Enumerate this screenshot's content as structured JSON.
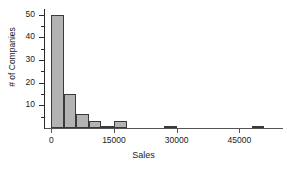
{
  "chart_data": {
    "type": "bar",
    "title": "",
    "xlabel": "Sales",
    "ylabel": "# of Companies",
    "bin_width": 3000,
    "xlim": [
      -1500,
      54000
    ],
    "ylim": [
      0,
      52
    ],
    "grid": false,
    "legend": null,
    "x_ticks": [
      0,
      15000,
      30000,
      45000
    ],
    "x_tick_labels": [
      "0",
      "15000",
      "30000",
      "45000"
    ],
    "y_ticks": [
      10,
      20,
      30,
      40,
      50
    ],
    "y_tick_labels": [
      "10",
      "20",
      "30",
      "40",
      "50"
    ],
    "y_minor_ticks": [
      5,
      15,
      25,
      35,
      45
    ],
    "bin_starts": [
      0,
      3000,
      6000,
      9000,
      12000,
      15000,
      27000,
      48000
    ],
    "values": [
      50,
      15,
      6,
      3,
      1,
      3,
      1,
      1
    ],
    "bars": [
      {
        "x0": 0,
        "x1": 3000,
        "value": 50
      },
      {
        "x0": 3000,
        "x1": 6000,
        "value": 15
      },
      {
        "x0": 6000,
        "x1": 9000,
        "value": 6
      },
      {
        "x0": 9000,
        "x1": 12000,
        "value": 3
      },
      {
        "x0": 12000,
        "x1": 15000,
        "value": 1
      },
      {
        "x0": 15000,
        "x1": 18000,
        "value": 3
      },
      {
        "x0": 27000,
        "x1": 30000,
        "value": 1
      },
      {
        "x0": 48000,
        "x1": 51000,
        "value": 1
      }
    ],
    "colors": {
      "bar_fill": "#b3b3b3",
      "bar_stroke": "#3a3a3a",
      "axis": "#2b2b2b",
      "text": "#1a1a1a",
      "background": "#ffffff"
    }
  }
}
